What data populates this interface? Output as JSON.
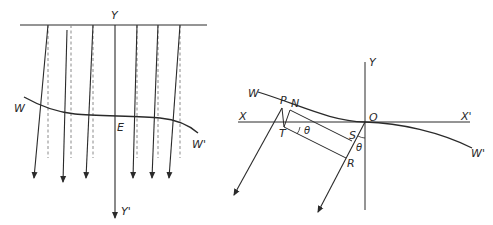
{
  "figure": {
    "left_panel": {
      "description": "Parallel rays crossing a wavefront WW' (deflected solid rays vs. undeflected dashed rays) along axis YY'",
      "labels": {
        "top": "Y",
        "bottom": "Y'",
        "wave_left": "W",
        "wave_right": "W'",
        "center": "E"
      },
      "solid_ray_count": 7,
      "dashed_ray_count": 6
    },
    "right_panel": {
      "description": "Wavefront WW' tangent to axis XX' at O; rays from P and O at angle theta from vertical",
      "labels": {
        "y_axis": "Y",
        "x_left": "X",
        "x_right": "X'",
        "origin": "O",
        "wave_left": "W",
        "wave_right": "W'",
        "point_p": "P",
        "point_n": "N",
        "point_t": "T",
        "point_s": "S",
        "point_r": "R",
        "angle_1": "θ",
        "angle_2": "θ"
      }
    },
    "colors": {
      "line": "#2a2a2a",
      "dashed": "#8a8a8a",
      "background": "#ffffff"
    }
  }
}
